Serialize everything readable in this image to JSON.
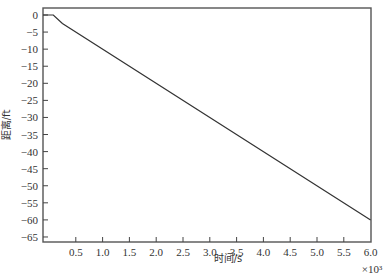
{
  "chart_data": {
    "type": "line",
    "title": "",
    "xlabel": "时间/s",
    "ylabel": "距离/ft",
    "x_exponent_label": "×10³",
    "xlim": [
      0,
      6.0
    ],
    "ylim": [
      -66,
      2
    ],
    "grid": false,
    "legend": null,
    "x_ticks": [
      0.5,
      1.0,
      1.5,
      2.0,
      2.5,
      3.0,
      3.5,
      4.0,
      4.5,
      5.0,
      5.5,
      6.0
    ],
    "x_tick_labels": [
      "0.5",
      "1.0",
      "1.5",
      "2.0",
      "2.5",
      "3.0",
      "3.5",
      "4.0",
      "4.5",
      "5.0",
      "5.5",
      "6.0"
    ],
    "y_ticks": [
      0,
      -5,
      -10,
      -15,
      -20,
      -25,
      -30,
      -35,
      -40,
      -45,
      -50,
      -55,
      -60,
      -65
    ],
    "y_tick_labels": [
      "0",
      "−5",
      "−10",
      "−15",
      "−20",
      "−25",
      "−30",
      "−35",
      "−40",
      "−45",
      "−50",
      "−55",
      "−60",
      "−65"
    ],
    "series": [
      {
        "name": "distance",
        "color": "#333333",
        "x": [
          -0.11,
          0.08,
          0.25,
          6.0
        ],
        "y": [
          0,
          0,
          -2.5,
          -60
        ]
      }
    ]
  }
}
